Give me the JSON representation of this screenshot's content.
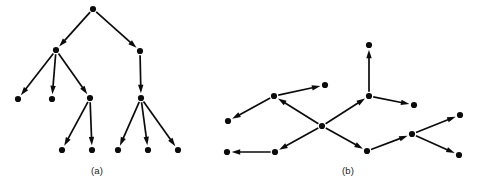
{
  "figure": {
    "type": "directed-graph-diagram",
    "background_color": "#ffffff",
    "ink_color": "#0b0b0b",
    "node_radius": 3.1,
    "arrow_length": 8.5,
    "arrow_half_width": 2.7,
    "width": 479,
    "height": 182,
    "panels": [
      {
        "id": "panel-a",
        "caption": "(a)",
        "caption_x": 97,
        "caption_y": 165,
        "description": "rooted directed tree, all edges point away from root",
        "nodes": [
          {
            "id": "a1",
            "x": 93,
            "y": 9
          },
          {
            "id": "a2",
            "x": 56,
            "y": 50
          },
          {
            "id": "a3",
            "x": 140,
            "y": 51
          },
          {
            "id": "a4",
            "x": 18,
            "y": 99
          },
          {
            "id": "a5",
            "x": 52,
            "y": 99
          },
          {
            "id": "a6",
            "x": 90,
            "y": 98
          },
          {
            "id": "a7",
            "x": 141,
            "y": 98
          },
          {
            "id": "a8",
            "x": 62,
            "y": 150
          },
          {
            "id": "a9",
            "x": 92,
            "y": 150
          },
          {
            "id": "a10",
            "x": 118,
            "y": 150
          },
          {
            "id": "a11",
            "x": 148,
            "y": 150
          },
          {
            "id": "a12",
            "x": 178,
            "y": 150
          }
        ],
        "edges": [
          {
            "from": "a1",
            "to": "a2"
          },
          {
            "from": "a1",
            "to": "a3"
          },
          {
            "from": "a2",
            "to": "a4"
          },
          {
            "from": "a2",
            "to": "a5"
          },
          {
            "from": "a2",
            "to": "a6"
          },
          {
            "from": "a3",
            "to": "a7"
          },
          {
            "from": "a6",
            "to": "a8"
          },
          {
            "from": "a6",
            "to": "a9"
          },
          {
            "from": "a7",
            "to": "a10"
          },
          {
            "from": "a7",
            "to": "a11"
          },
          {
            "from": "a7",
            "to": "a12"
          }
        ]
      },
      {
        "id": "panel-b",
        "caption": "(b)",
        "caption_x": 348,
        "caption_y": 165,
        "description": "directed graph with two hub vertices and mixed edge orientations",
        "nodes": [
          {
            "id": "b1",
            "x": 369,
            "y": 45
          },
          {
            "id": "b2",
            "x": 325,
            "y": 85
          },
          {
            "id": "b3",
            "x": 274,
            "y": 96
          },
          {
            "id": "b4",
            "x": 369,
            "y": 96
          },
          {
            "id": "b5",
            "x": 414,
            "y": 105
          },
          {
            "id": "b6",
            "x": 228,
            "y": 121
          },
          {
            "id": "b7",
            "x": 322,
            "y": 126
          },
          {
            "id": "b8",
            "x": 460,
            "y": 115
          },
          {
            "id": "b9",
            "x": 412,
            "y": 134
          },
          {
            "id": "b10",
            "x": 227,
            "y": 152
          },
          {
            "id": "b11",
            "x": 275,
            "y": 152
          },
          {
            "id": "b12",
            "x": 367,
            "y": 151
          },
          {
            "id": "b13",
            "x": 459,
            "y": 155
          }
        ],
        "edges": [
          {
            "from": "b4",
            "to": "b1"
          },
          {
            "from": "b3",
            "to": "b2"
          },
          {
            "from": "b3",
            "to": "b6"
          },
          {
            "from": "b7",
            "to": "b3"
          },
          {
            "from": "b7",
            "to": "b4"
          },
          {
            "from": "b4",
            "to": "b5"
          },
          {
            "from": "b7",
            "to": "b11"
          },
          {
            "from": "b11",
            "to": "b10"
          },
          {
            "from": "b7",
            "to": "b12"
          },
          {
            "from": "b12",
            "to": "b9"
          },
          {
            "from": "b9",
            "to": "b8"
          },
          {
            "from": "b9",
            "to": "b13"
          }
        ]
      }
    ]
  }
}
